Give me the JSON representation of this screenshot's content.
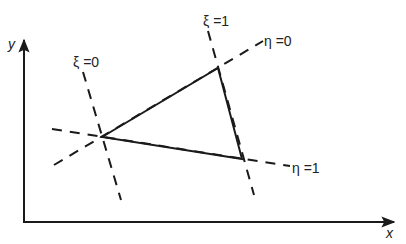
{
  "diagram": {
    "axes": {
      "x_label": "x",
      "y_label": "y"
    },
    "element": {
      "shape": "triangle"
    },
    "coordinate_lines": [
      {
        "name": "xi-0",
        "label": "ξ = 0"
      },
      {
        "name": "xi-1",
        "label": "ξ = 1"
      },
      {
        "name": "eta-0",
        "label": "η = 0"
      },
      {
        "name": "eta-1",
        "label": "η = 1"
      }
    ],
    "labels": {
      "xi0": "ξ =0",
      "xi1": "ξ =1",
      "eta0": "η =0",
      "eta1": "η =1"
    }
  }
}
